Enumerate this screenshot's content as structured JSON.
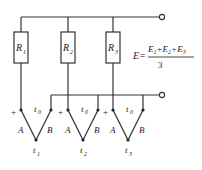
{
  "diagram": {
    "resistors": [
      {
        "label": "R",
        "sub": "1"
      },
      {
        "label": "R",
        "sub": "2"
      },
      {
        "label": "R",
        "sub": "3"
      }
    ],
    "formula": {
      "lhs": "E=",
      "numerator": [
        "E",
        "1",
        "+E",
        "2",
        "+E",
        "3"
      ],
      "denominator": "3"
    },
    "thermocouples": [
      {
        "plus": "+",
        "ref": "t",
        "ref_sub": "0",
        "leg_a": "A",
        "leg_b": "B",
        "junction": "t",
        "junction_sub": "1"
      },
      {
        "plus": "+",
        "ref": "t",
        "ref_sub": "0",
        "leg_a": "A",
        "leg_b": "B",
        "junction": "t",
        "junction_sub": "2"
      },
      {
        "plus": "+",
        "ref": "t",
        "ref_sub": "0",
        "leg_a": "A",
        "leg_b": "B",
        "junction": "t",
        "junction_sub": "3"
      }
    ],
    "colors": {
      "line": "#333333",
      "text": "#222222",
      "background": "#ffffff"
    }
  }
}
